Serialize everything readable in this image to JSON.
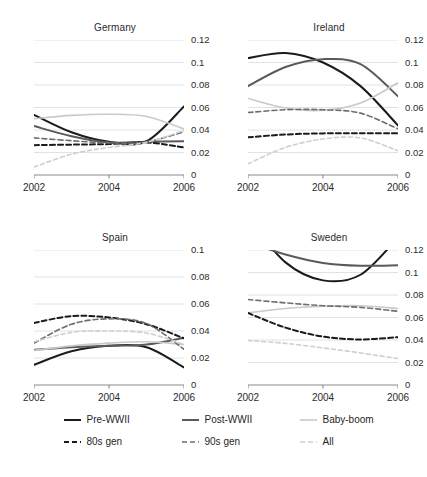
{
  "figure": {
    "caption": "",
    "palette": {
      "pre_wwii": "#1b1b1b",
      "post_wwii": "#5a5a5a",
      "baby_boom": "#c9c9c9",
      "gen80s": "#1b1b1b",
      "gen90s": "#6e6e6e",
      "all": "#cfcfcf",
      "grid": "#e2e2e2",
      "axis": "#8a8a8a",
      "text": "#2b2b2b"
    }
  },
  "legend": {
    "position": "bottom-center",
    "rows": [
      [
        {
          "label": "Pre-WWII",
          "style": "solid",
          "color": "#1b1b1b",
          "width": 2.0
        },
        {
          "label": "Post-WWII",
          "style": "solid",
          "color": "#5a5a5a",
          "width": 2.0
        },
        {
          "label": "Baby-boom",
          "style": "solid",
          "color": "#c9c9c9",
          "width": 1.6
        }
      ],
      [
        {
          "label": "80s gen",
          "style": "dashed",
          "color": "#1b1b1b",
          "width": 2.0
        },
        {
          "label": "90s gen",
          "style": "dashed",
          "color": "#6e6e6e",
          "width": 1.6
        },
        {
          "label": "All",
          "style": "dashed",
          "color": "#cfcfcf",
          "width": 1.6
        }
      ]
    ]
  },
  "chart_data": [
    {
      "type": "line",
      "title": "Germany",
      "xlabel": "",
      "ylabel": "",
      "x": [
        2002,
        2003,
        2004,
        2005,
        2006
      ],
      "xlim": [
        2002,
        2006
      ],
      "xticks": [
        2002,
        2004,
        2006
      ],
      "xticklabels": [
        "2002",
        "2004",
        "2006"
      ],
      "ylim": [
        0,
        0.12
      ],
      "yticks": [
        0,
        0.02,
        0.04,
        0.06,
        0.08,
        0.1,
        0.12
      ],
      "yticklabels": [
        "0",
        "0.02",
        "0.04",
        "0.06",
        "0.08",
        "0.1",
        "0.12"
      ],
      "grid": true,
      "series": [
        {
          "name": "Pre-WWII",
          "values": [
            0.0535,
            0.038,
            0.0295,
            0.03,
            0.061
          ]
        },
        {
          "name": "Post-WWII",
          "values": [
            0.0435,
            0.0345,
            0.029,
            0.0295,
            0.03
          ]
        },
        {
          "name": "Baby-boom",
          "values": [
            0.05,
            0.053,
            0.054,
            0.052,
            0.041
          ]
        },
        {
          "name": "80s gen",
          "values": [
            0.0265,
            0.027,
            0.0275,
            0.029,
            0.0245
          ]
        },
        {
          "name": "90s gen",
          "values": [
            0.033,
            0.0305,
            0.0285,
            0.0295,
            0.0385
          ]
        },
        {
          "name": "All",
          "values": [
            0.007,
            0.0185,
            0.0245,
            0.029,
            0.0395
          ]
        }
      ]
    },
    {
      "type": "line",
      "title": "Ireland",
      "xlabel": "",
      "ylabel": "",
      "x": [
        2002,
        2003,
        2004,
        2005,
        2006
      ],
      "xlim": [
        2002,
        2006
      ],
      "xticks": [
        2002,
        2004,
        2006
      ],
      "xticklabels": [
        "2002",
        "2004",
        "2006"
      ],
      "ylim": [
        0,
        0.12
      ],
      "yticks": [
        0,
        0.02,
        0.04,
        0.06,
        0.08,
        0.1,
        0.12
      ],
      "yticklabels": [
        "0",
        "0.02",
        "0.04",
        "0.06",
        "0.08",
        "0.1",
        "0.12"
      ],
      "grid": true,
      "series": [
        {
          "name": "Pre-WWII",
          "values": [
            0.104,
            0.1085,
            0.1,
            0.079,
            0.044
          ]
        },
        {
          "name": "Post-WWII",
          "values": [
            0.079,
            0.096,
            0.103,
            0.0985,
            0.07
          ]
        },
        {
          "name": "Baby-boom",
          "values": [
            0.068,
            0.0595,
            0.0575,
            0.064,
            0.082
          ]
        },
        {
          "name": "80s gen",
          "values": [
            0.0335,
            0.036,
            0.037,
            0.0372,
            0.037
          ]
        },
        {
          "name": "90s gen",
          "values": [
            0.0555,
            0.058,
            0.058,
            0.055,
            0.041
          ]
        },
        {
          "name": "All",
          "values": [
            0.01,
            0.0245,
            0.032,
            0.033,
            0.0215
          ]
        }
      ]
    },
    {
      "type": "line",
      "title": "Spain",
      "xlabel": "",
      "ylabel": "",
      "x": [
        2002,
        2003,
        2004,
        2005,
        2006
      ],
      "xlim": [
        2002,
        2006
      ],
      "xticks": [
        2002,
        2004,
        2006
      ],
      "xticklabels": [
        "2002",
        "2004",
        "2006"
      ],
      "ylim": [
        0,
        0.1
      ],
      "yticks": [
        0,
        0.02,
        0.04,
        0.06,
        0.08,
        0.1
      ],
      "yticklabels": [
        "0",
        "0.02",
        "0.04",
        "0.06",
        "0.08",
        "0.1"
      ],
      "grid": true,
      "series": [
        {
          "name": "Pre-WWII",
          "values": [
            0.015,
            0.025,
            0.029,
            0.028,
            0.013
          ]
        },
        {
          "name": "Post-WWII",
          "values": [
            0.026,
            0.028,
            0.029,
            0.03,
            0.035
          ]
        },
        {
          "name": "Baby-boom",
          "values": [
            0.0255,
            0.029,
            0.031,
            0.032,
            0.03
          ]
        },
        {
          "name": "80s gen",
          "values": [
            0.046,
            0.051,
            0.05,
            0.045,
            0.0345
          ]
        },
        {
          "name": "90s gen",
          "values": [
            0.031,
            0.045,
            0.049,
            0.0455,
            0.0265
          ]
        },
        {
          "name": "All",
          "values": [
            0.032,
            0.039,
            0.04,
            0.0385,
            0.03
          ]
        }
      ]
    },
    {
      "type": "line",
      "title": "Sweden",
      "xlabel": "",
      "ylabel": "",
      "x": [
        2002,
        2003,
        2004,
        2005,
        2006
      ],
      "xlim": [
        2002,
        2006
      ],
      "xticks": [
        2002,
        2004,
        2006
      ],
      "xticklabels": [
        "2002",
        "2004",
        "2006"
      ],
      "ylim": [
        0,
        0.12
      ],
      "yticks": [
        0,
        0.02,
        0.04,
        0.06,
        0.08,
        0.1,
        0.12
      ],
      "yticklabels": [
        "0",
        "0.02",
        "0.04",
        "0.06",
        "0.08",
        "0.1",
        "0.12"
      ],
      "grid": true,
      "series": [
        {
          "name": "Pre-WWII",
          "values": [
            0.148,
            0.109,
            0.093,
            0.098,
            0.131
          ]
        },
        {
          "name": "Post-WWII",
          "values": [
            0.127,
            0.116,
            0.1085,
            0.106,
            0.1065
          ]
        },
        {
          "name": "Baby-boom",
          "values": [
            0.064,
            0.068,
            0.07,
            0.0705,
            0.068
          ]
        },
        {
          "name": "80s gen",
          "values": [
            0.064,
            0.051,
            0.043,
            0.0405,
            0.0425
          ]
        },
        {
          "name": "90s gen",
          "values": [
            0.076,
            0.073,
            0.0705,
            0.069,
            0.0655
          ]
        },
        {
          "name": "All",
          "values": [
            0.0395,
            0.037,
            0.033,
            0.0285,
            0.0235
          ]
        }
      ]
    }
  ]
}
